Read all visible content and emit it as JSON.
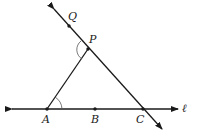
{
  "diagram": {
    "points": {
      "Q": {
        "label": "Q",
        "x": 69,
        "y": 26
      },
      "P": {
        "label": "P",
        "x": 88,
        "y": 49
      },
      "A": {
        "label": "A",
        "x": 47,
        "y": 109
      },
      "B": {
        "label": "B",
        "x": 95,
        "y": 109
      },
      "C": {
        "label": "C",
        "x": 143,
        "y": 109
      }
    },
    "line_label": "ℓ",
    "stroke_color": "#1a1a1a"
  }
}
